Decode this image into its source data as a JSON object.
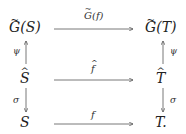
{
  "diagram": {
    "type": "commutative-diagram",
    "nodes": {
      "top_left": {
        "accent": "~",
        "base": "G",
        "arg": "(S)"
      },
      "top_right": {
        "accent": "~",
        "base": "G",
        "arg": "(T)"
      },
      "mid_left": {
        "accent": "^",
        "base": "S"
      },
      "mid_right": {
        "accent": "^",
        "base": "T"
      },
      "bot_left": {
        "base": "S"
      },
      "bot_right": {
        "base": "T."
      }
    },
    "arrows": {
      "top": {
        "accent": "~",
        "base": "G",
        "arg": "(f)",
        "from": "top_left",
        "to": "top_right"
      },
      "mid": {
        "accent": "^",
        "base": "f",
        "from": "mid_left",
        "to": "mid_right"
      },
      "bot": {
        "base": "f",
        "from": "bot_left",
        "to": "bot_right"
      },
      "left_up": {
        "label": "ψ",
        "from": "mid_left",
        "to": "top_left"
      },
      "right_up": {
        "label": "ψ",
        "from": "mid_right",
        "to": "top_right"
      },
      "left_down": {
        "label": "σ",
        "from": "mid_left",
        "to": "bot_left"
      },
      "right_down": {
        "label": "σ",
        "from": "mid_right",
        "to": "bot_right"
      }
    },
    "colors": {
      "ink": "#222222",
      "arrow": "#555555"
    }
  }
}
